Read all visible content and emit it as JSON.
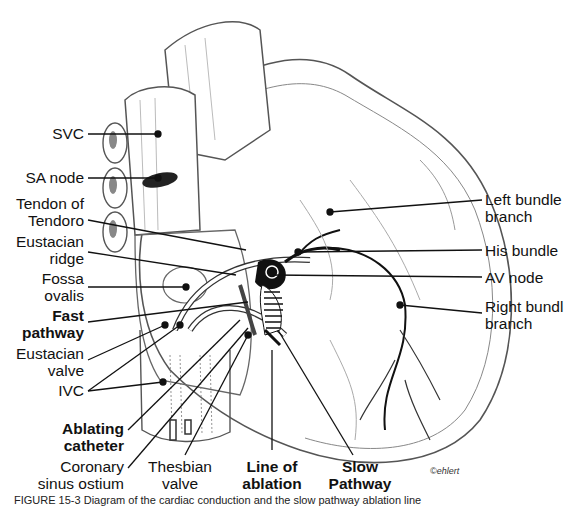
{
  "figure": {
    "credit": "©ehlert",
    "caption": "FIGURE 15-3 Diagram of the cardiac conduction and the slow pathway ablation line",
    "colors": {
      "ink": "#111111",
      "line": "#555555",
      "node": "#1a1a1a",
      "background": "#ffffff"
    }
  },
  "labels": {
    "svc": "SVC",
    "sa_node": "SA node",
    "tendon_1": "Tendon of",
    "tendon_2": "Tendoro",
    "eustacian_ridge_1": "Eustacian",
    "eustacian_ridge_2": "ridge",
    "fossa_1": "Fossa",
    "fossa_2": "ovalis",
    "fast_1": "Fast",
    "fast_2": "pathway",
    "eust_valve_1": "Eustacian",
    "eust_valve_2": "valve",
    "ivc": "IVC",
    "ablating_1": "Ablating",
    "ablating_2": "catheter",
    "coronary_1": "Coronary",
    "coronary_2": "sinus ostium",
    "thesbian_1": "Thesbian",
    "thesbian_2": "valve",
    "line_abl_1": "Line of",
    "line_abl_2": "ablation",
    "slow_1": "Slow",
    "slow_2": "Pathway",
    "left_bundle_1": "Left bundle",
    "left_bundle_2": "branch",
    "his_bundle": "His bundle",
    "av_node": "AV node",
    "right_bundle_1": "Right bundl",
    "right_bundle_2": "branch"
  }
}
